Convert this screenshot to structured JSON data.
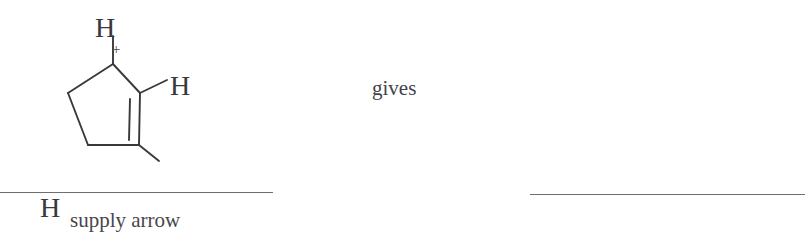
{
  "figure": {
    "kind": "chemistry-reaction-prompt",
    "background_color": "#ffffff",
    "ink_color": "#39393d",
    "rule_color": "#6d6d73"
  },
  "molecule": {
    "name": "cyclopentenyl cation",
    "ring_label": "cyclopentene-ring",
    "atoms": [
      {
        "id": "h-top",
        "label": "H"
      },
      {
        "id": "h-right",
        "label": "H"
      },
      {
        "id": "h-bottom",
        "label": "H"
      }
    ],
    "charge": {
      "label": "+",
      "sign_name": "positive-charge"
    },
    "bonds": {
      "double_bond_label": "double-bond",
      "single_bond_label": "single-bond"
    }
  },
  "connective": {
    "label": "gives"
  },
  "answer_slots": [
    {
      "id": "left-slot",
      "caption": "supply arrow"
    },
    {
      "id": "right-slot",
      "caption": ""
    }
  ]
}
